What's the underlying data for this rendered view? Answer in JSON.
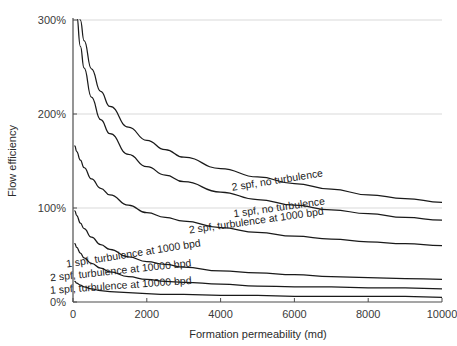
{
  "chart_data": {
    "type": "line",
    "title": "",
    "xlabel": "Formation permeability (md)",
    "ylabel": "Flow efficiency",
    "xlim": [
      0,
      10000
    ],
    "ylim": [
      0,
      300
    ],
    "xticks": [
      "0",
      "2000",
      "4000",
      "6000",
      "8000",
      "10000"
    ],
    "xtick_values": [
      0,
      2000,
      4000,
      6000,
      8000,
      10000
    ],
    "yticks": [
      "0%",
      "100%",
      "200%",
      "300%"
    ],
    "ytick_values": [
      0,
      100,
      200,
      300
    ],
    "grid": "horizontal",
    "legend": "inline-curve-labels",
    "x": [
      50,
      100,
      200,
      300,
      500,
      750,
      1000,
      1500,
      2000,
      2500,
      3000,
      4000,
      5000,
      6000,
      7000,
      8000,
      9000,
      10000
    ],
    "series": [
      {
        "name": "2 spf, no turbulence",
        "label": "2 spf, no turbulence",
        "label_x": 5550,
        "label_y": 126,
        "label_angle": -9,
        "values": [
          352,
          330,
          300,
          278,
          248,
          224,
          208,
          186,
          172,
          162,
          154,
          142,
          133,
          126,
          120,
          114,
          110,
          106
        ]
      },
      {
        "name": "1 spf, no turbulence",
        "label": "1 spf, no turbulence",
        "label_x": 5600,
        "label_y": 97,
        "label_angle": -8,
        "values": [
          330,
          305,
          272,
          249,
          218,
          194,
          179,
          157,
          144,
          135,
          128,
          117,
          109,
          103,
          98,
          94,
          90,
          87
        ]
      },
      {
        "name": "2 spf, turbulence at 1000 bpd",
        "label": "2 spf, turbulence at 1000 bpd",
        "label_x": 4980,
        "label_y": 83,
        "label_angle": -8,
        "values": [
          166,
          160,
          151,
          143,
          131,
          121,
          114,
          103,
          95,
          90,
          86,
          79,
          74,
          70,
          67,
          64,
          62,
          60
        ]
      },
      {
        "name": "1 spf, turbulence at 1000 bpd",
        "label": "1 spf, turbulence at 1000 bpd",
        "label_x": 1650,
        "label_y": 48,
        "label_angle": -9,
        "values": [
          97,
          92,
          84,
          78,
          69,
          61,
          56,
          48,
          43,
          40,
          37,
          33,
          31,
          29,
          27,
          26,
          25,
          24
        ]
      },
      {
        "name": "2 spf, turbulence at 10000 bpd",
        "label": "2 spf, turbulence at 10000 bpd",
        "label_x": 1300,
        "label_y": 30,
        "label_angle": -6,
        "values": [
          62,
          58,
          52,
          47,
          41,
          36,
          32,
          27,
          24,
          22,
          21,
          19,
          17,
          16,
          16,
          15,
          15,
          14
        ]
      },
      {
        "name": "1 spf, turbulence at 10000 bpd",
        "label": "1 spf, turbulence at 10000 bpd",
        "label_x": 1300,
        "label_y": 14,
        "label_angle": -4,
        "values": [
          22,
          20,
          18,
          16,
          14,
          12,
          11,
          10,
          9,
          8,
          8,
          7,
          7,
          6,
          6,
          6,
          6,
          5
        ]
      }
    ]
  }
}
